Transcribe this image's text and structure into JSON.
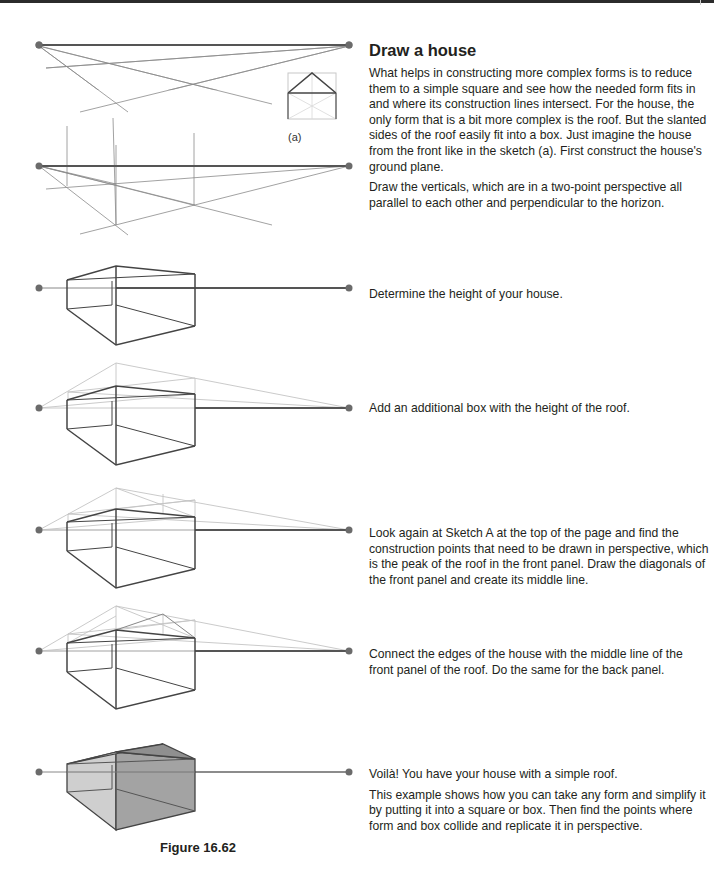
{
  "page": {
    "title": "Draw a house",
    "figure_caption": "Figure 16.62",
    "sketch_a_label": "(a)"
  },
  "steps": [
    {
      "id": "ground-plane",
      "paragraphs": [
        "What helps in constructing more complex forms is to reduce them to a simple square and see how the needed form fits in and where its construction lines intersect. For the house, the only form that is a bit more complex is the roof. But the slanted sides of the roof easily fit into a box. Just imagine the house from the front like in the sketch (a). First construct the house's ground plane.",
        "Draw the verticals, which are in a two-point perspective all parallel to each other and perpendicular to the horizon."
      ]
    },
    {
      "id": "height",
      "paragraphs": [
        "Determine the height of your house."
      ]
    },
    {
      "id": "roof-box",
      "paragraphs": [
        "Add an additional box with the height of the roof."
      ]
    },
    {
      "id": "construction-points",
      "paragraphs": [
        "Look again at Sketch A at the top of the page and find the construction points that need to be drawn in perspective, which is the peak of the roof in the front panel. Draw the diagonals of the front panel and create its middle line."
      ]
    },
    {
      "id": "connect-edges",
      "paragraphs": [
        "Connect the edges of the house with the middle line of the front panel of the roof. Do the same for the back panel."
      ]
    },
    {
      "id": "finished",
      "paragraphs": [
        "Voilà! You have your house with a simple roof.",
        "This example shows how you can take any form and simplify it by putting it into a square or box. Then find the points where form and box collide and replicate it in perspective."
      ]
    }
  ],
  "colors": {
    "text": "#231f20",
    "dark_line": "#4a4a4a",
    "light_line": "#bdbdbd",
    "vanishing_point": "#6b6b6b",
    "roof_fill": "#8f8f8f",
    "wall_fill_light": "#c8c8c8",
    "wall_fill_dark": "#a2a2a2"
  }
}
